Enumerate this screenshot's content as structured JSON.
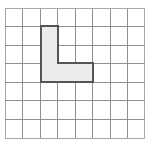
{
  "figure": {
    "title": "Grid with shaded L-shaped region",
    "background_color": "#ffffff"
  },
  "grid": {
    "columns": 8,
    "rows": 7,
    "cell_size_px": 17.5,
    "origin_x_px": 5,
    "origin_y_px": 8,
    "line_color": "#8f8f8f",
    "edge_color": "#a8a8a8",
    "show_grid": true
  },
  "shape": {
    "name": "L-shape",
    "cell_count": 5,
    "fill_color": "#ececec",
    "outline_color": "#555555",
    "outline_width_px": 2,
    "cells": [
      {
        "col": 2,
        "row": 1
      },
      {
        "col": 2,
        "row": 2
      },
      {
        "col": 2,
        "row": 3
      },
      {
        "col": 3,
        "row": 3
      },
      {
        "col": 4,
        "row": 3
      }
    ],
    "outline_path": [
      {
        "col": 2,
        "row": 1
      },
      {
        "col": 3,
        "row": 1
      },
      {
        "col": 3,
        "row": 3
      },
      {
        "col": 5,
        "row": 3
      },
      {
        "col": 5,
        "row": 4
      },
      {
        "col": 2,
        "row": 4
      }
    ],
    "description": "Vertical arm three cells tall in column 3, with a horizontal arm two cells long extending right from the bottom cell"
  }
}
